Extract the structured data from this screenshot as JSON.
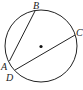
{
  "diagram": {
    "type": "circle-chords",
    "points": {
      "A": {
        "label": "A"
      },
      "B": {
        "label": "B"
      },
      "C": {
        "label": "C"
      },
      "D": {
        "label": "D"
      }
    },
    "chords": [
      [
        "A",
        "B"
      ],
      [
        "D",
        "C"
      ]
    ],
    "center_marked": true,
    "stroke_color": "#222222"
  }
}
